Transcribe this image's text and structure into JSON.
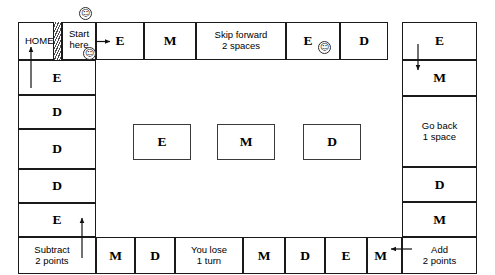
{
  "board": {
    "title": "Board game track",
    "colors": {
      "ink": "#1a1a1a",
      "paper": "#ffffff",
      "card_border": "#3a3a3a"
    },
    "home": {
      "label": "HOME"
    },
    "start": {
      "label_line1": "Start",
      "label_line2": "here"
    },
    "top_row": [
      {
        "type": "letter",
        "label": "E"
      },
      {
        "type": "letter",
        "label": "M"
      },
      {
        "type": "instruction",
        "line1": "Skip forward",
        "line2": "2 spaces"
      },
      {
        "type": "letter",
        "label": "E",
        "smiley": true
      },
      {
        "type": "letter",
        "label": "D"
      },
      {
        "type": "letter",
        "label": "E"
      }
    ],
    "right_column": [
      {
        "type": "letter",
        "label": "M"
      },
      {
        "type": "instruction",
        "line1": "Go back",
        "line2": "1 space"
      },
      {
        "type": "letter",
        "label": "D"
      },
      {
        "type": "letter",
        "label": "M"
      }
    ],
    "bottom_right_corner": {
      "type": "instruction",
      "line1": "Add",
      "line2": "2 points"
    },
    "bottom_row": [
      {
        "type": "letter",
        "label": "M"
      },
      {
        "type": "letter",
        "label": "D"
      },
      {
        "type": "instruction",
        "line1": "You lose",
        "line2": "1 turn"
      },
      {
        "type": "letter",
        "label": "M"
      },
      {
        "type": "letter",
        "label": "D"
      },
      {
        "type": "letter",
        "label": "E"
      },
      {
        "type": "letter",
        "label": "M"
      }
    ],
    "bottom_left_corner": {
      "type": "instruction",
      "line1": "Subtract",
      "line2": "2 points"
    },
    "left_column": [
      {
        "type": "letter",
        "label": "E"
      },
      {
        "type": "letter",
        "label": "D"
      },
      {
        "type": "letter",
        "label": "D"
      },
      {
        "type": "letter",
        "label": "D"
      },
      {
        "type": "letter",
        "label": "E"
      }
    ],
    "center_cards": [
      {
        "label": "E"
      },
      {
        "label": "M"
      },
      {
        "label": "D"
      }
    ],
    "tokens": [
      {
        "name": "smiley-token-above-start",
        "glyph": "☺"
      },
      {
        "name": "smiley-token-at-start",
        "glyph": "☺"
      },
      {
        "name": "smiley-token-on-top-e",
        "glyph": "☺"
      }
    ],
    "arrows": [
      {
        "name": "arrow-start-to-first-space",
        "direction": "right"
      },
      {
        "name": "arrow-top-right-down",
        "direction": "down"
      },
      {
        "name": "arrow-add-points-to-m",
        "direction": "left"
      },
      {
        "name": "arrow-subtract-points-up",
        "direction": "up"
      },
      {
        "name": "arrow-left-column-to-home",
        "direction": "up"
      }
    ]
  }
}
